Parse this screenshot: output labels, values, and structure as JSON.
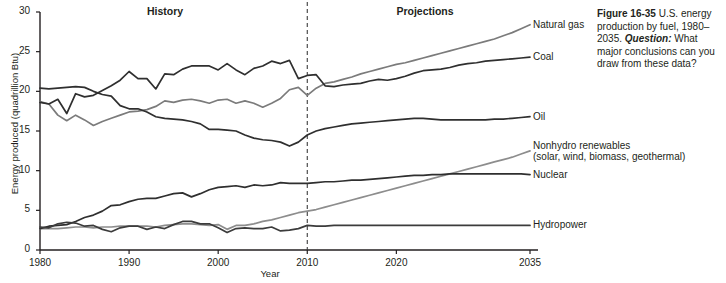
{
  "caption": {
    "figure_number": "Figure 16-35",
    "body_1": " U.S. energy production by fuel, 1980–2035. ",
    "question_label": "Question:",
    "body_2": " What major conclusions can you draw from these data?"
  },
  "chart_data": {
    "type": "line",
    "title": "",
    "xlabel": "Year",
    "ylabel": "Energy produced (quadrillion Btu)",
    "xlim": [
      1980,
      2035
    ],
    "ylim": [
      0,
      30
    ],
    "xticks": [
      1980,
      1990,
      2000,
      2010,
      2020,
      2035
    ],
    "yticks": [
      0,
      5,
      10,
      15,
      20,
      25,
      30
    ],
    "grid": false,
    "legend_position": "right-inline",
    "annotations": [
      {
        "text": "History",
        "x": 1992,
        "y": 31.0,
        "bold": true
      },
      {
        "text": "Projections",
        "x": 2022,
        "y": 31.0,
        "bold": true
      }
    ],
    "divider": {
      "x": 2010,
      "style": "dashed",
      "label": "history/projection boundary"
    },
    "series": [
      {
        "name": "Natural gas",
        "color": "#7b7b7b",
        "label_lines": [
          "Natural gas"
        ],
        "x": [
          1980,
          1981,
          1982,
          1983,
          1984,
          1985,
          1986,
          1987,
          1988,
          1989,
          1990,
          1991,
          1992,
          1993,
          1994,
          1995,
          1996,
          1997,
          1998,
          1999,
          2000,
          2001,
          2002,
          2003,
          2004,
          2005,
          2006,
          2007,
          2008,
          2009,
          2010,
          2011,
          2012,
          2013,
          2014,
          2015,
          2016,
          2017,
          2018,
          2019,
          2020,
          2021,
          2022,
          2023,
          2024,
          2025,
          2026,
          2027,
          2028,
          2029,
          2030,
          2031,
          2032,
          2033,
          2034,
          2035
        ],
        "y": [
          18.7,
          18.4,
          17.0,
          16.3,
          17.0,
          16.4,
          15.7,
          16.2,
          16.6,
          17.0,
          17.4,
          17.5,
          17.7,
          18.1,
          18.8,
          18.6,
          18.9,
          19.0,
          18.8,
          18.5,
          18.9,
          19.0,
          18.5,
          18.8,
          18.5,
          18.0,
          18.5,
          19.1,
          20.2,
          20.5,
          19.5,
          20.4,
          21.0,
          21.2,
          21.5,
          21.8,
          22.2,
          22.5,
          22.8,
          23.1,
          23.4,
          23.6,
          23.9,
          24.2,
          24.5,
          24.8,
          25.1,
          25.4,
          25.7,
          26.0,
          26.3,
          26.6,
          27.0,
          27.4,
          27.9,
          28.4
        ]
      },
      {
        "name": "Coal",
        "color": "#2f2f2f",
        "label_lines": [
          "Coal"
        ],
        "x": [
          1980,
          1981,
          1982,
          1983,
          1984,
          1985,
          1986,
          1987,
          1988,
          1989,
          1990,
          1991,
          1992,
          1993,
          1994,
          1995,
          1996,
          1997,
          1998,
          1999,
          2000,
          2001,
          2002,
          2003,
          2004,
          2005,
          2006,
          2007,
          2008,
          2009,
          2010,
          2011,
          2012,
          2013,
          2014,
          2015,
          2016,
          2017,
          2018,
          2019,
          2020,
          2021,
          2022,
          2023,
          2024,
          2025,
          2026,
          2027,
          2028,
          2029,
          2030,
          2031,
          2032,
          2033,
          2034,
          2035
        ],
        "y": [
          18.6,
          18.4,
          19.0,
          17.2,
          19.7,
          19.3,
          19.5,
          20.1,
          20.7,
          21.4,
          22.5,
          21.6,
          21.6,
          20.3,
          22.2,
          22.1,
          22.8,
          23.2,
          23.2,
          23.2,
          22.7,
          23.5,
          22.7,
          22.1,
          22.9,
          23.2,
          23.8,
          23.5,
          23.9,
          21.6,
          22.0,
          22.1,
          20.7,
          20.6,
          20.8,
          20.9,
          21.0,
          21.3,
          21.5,
          21.4,
          21.6,
          21.9,
          22.3,
          22.6,
          22.7,
          22.8,
          23.0,
          23.3,
          23.5,
          23.6,
          23.8,
          23.9,
          24.0,
          24.1,
          24.2,
          24.3
        ]
      },
      {
        "name": "Oil",
        "color": "#2f2f2f",
        "label_lines": [
          "Oil"
        ],
        "x": [
          1980,
          1981,
          1982,
          1983,
          1984,
          1985,
          1986,
          1987,
          1988,
          1989,
          1990,
          1991,
          1992,
          1993,
          1994,
          1995,
          1996,
          1997,
          1998,
          1999,
          2000,
          2001,
          2002,
          2003,
          2004,
          2005,
          2006,
          2007,
          2008,
          2009,
          2010,
          2011,
          2012,
          2013,
          2014,
          2015,
          2016,
          2017,
          2018,
          2019,
          2020,
          2021,
          2022,
          2023,
          2024,
          2025,
          2026,
          2027,
          2028,
          2029,
          2030,
          2031,
          2032,
          2033,
          2034,
          2035
        ],
        "y": [
          20.4,
          20.3,
          20.4,
          20.5,
          20.6,
          20.5,
          20.0,
          19.6,
          19.4,
          18.2,
          17.8,
          17.8,
          17.4,
          16.8,
          16.6,
          16.5,
          16.4,
          16.2,
          15.9,
          15.2,
          15.2,
          15.1,
          15.0,
          14.5,
          14.1,
          13.9,
          13.8,
          13.6,
          13.1,
          13.6,
          14.5,
          15.0,
          15.3,
          15.5,
          15.7,
          15.9,
          16.0,
          16.1,
          16.2,
          16.3,
          16.4,
          16.5,
          16.6,
          16.6,
          16.5,
          16.4,
          16.4,
          16.4,
          16.4,
          16.4,
          16.4,
          16.5,
          16.5,
          16.6,
          16.7,
          16.8
        ]
      },
      {
        "name": "Nonhydro renewables",
        "color": "#8d8d8d",
        "label_lines": [
          "Nonhydro renewables",
          "(solar, wind, biomass, geothermal)"
        ],
        "x": [
          1980,
          1981,
          1982,
          1983,
          1984,
          1985,
          1986,
          1987,
          1988,
          1989,
          1990,
          1991,
          1992,
          1993,
          1994,
          1995,
          1996,
          1997,
          1998,
          1999,
          2000,
          2001,
          2002,
          2003,
          2004,
          2005,
          2006,
          2007,
          2008,
          2009,
          2010,
          2011,
          2012,
          2013,
          2014,
          2015,
          2016,
          2017,
          2018,
          2019,
          2020,
          2021,
          2022,
          2023,
          2024,
          2025,
          2026,
          2027,
          2028,
          2029,
          2030,
          2031,
          2032,
          2033,
          2034,
          2035
        ],
        "y": [
          2.7,
          2.7,
          2.7,
          2.8,
          2.9,
          2.9,
          2.8,
          2.9,
          2.9,
          3.0,
          3.0,
          3.0,
          3.0,
          2.9,
          3.1,
          3.2,
          3.3,
          3.3,
          3.2,
          3.1,
          3.2,
          2.6,
          3.1,
          3.1,
          3.3,
          3.6,
          3.8,
          4.1,
          4.4,
          4.7,
          4.9,
          5.1,
          5.4,
          5.7,
          6.0,
          6.3,
          6.6,
          6.9,
          7.2,
          7.5,
          7.8,
          8.1,
          8.4,
          8.7,
          9.0,
          9.3,
          9.6,
          9.9,
          10.2,
          10.5,
          10.8,
          11.1,
          11.4,
          11.7,
          12.1,
          12.5
        ]
      },
      {
        "name": "Nuclear",
        "color": "#2f2f2f",
        "label_lines": [
          "Nuclear"
        ],
        "x": [
          1980,
          1981,
          1982,
          1983,
          1984,
          1985,
          1986,
          1987,
          1988,
          1989,
          1990,
          1991,
          1992,
          1993,
          1994,
          1995,
          1996,
          1997,
          1998,
          1999,
          2000,
          2001,
          2002,
          2003,
          2004,
          2005,
          2006,
          2007,
          2008,
          2009,
          2010,
          2011,
          2012,
          2013,
          2014,
          2015,
          2016,
          2017,
          2018,
          2019,
          2020,
          2021,
          2022,
          2023,
          2024,
          2025,
          2026,
          2027,
          2028,
          2029,
          2030,
          2031,
          2032,
          2033,
          2034,
          2035
        ],
        "y": [
          2.7,
          3.0,
          3.1,
          3.2,
          3.6,
          4.1,
          4.4,
          4.9,
          5.6,
          5.7,
          6.1,
          6.4,
          6.5,
          6.5,
          6.8,
          7.1,
          7.2,
          6.7,
          7.1,
          7.6,
          7.9,
          8.0,
          8.1,
          7.9,
          8.2,
          8.1,
          8.2,
          8.5,
          8.4,
          8.4,
          8.4,
          8.5,
          8.6,
          8.6,
          8.7,
          8.8,
          8.8,
          8.9,
          9.0,
          9.1,
          9.2,
          9.3,
          9.4,
          9.4,
          9.5,
          9.5,
          9.6,
          9.6,
          9.6,
          9.6,
          9.6,
          9.6,
          9.6,
          9.6,
          9.6,
          9.5
        ]
      },
      {
        "name": "Hydropower",
        "color": "#3c3c3c",
        "label_lines": [
          "Hydropower"
        ],
        "x": [
          1980,
          1981,
          1982,
          1983,
          1984,
          1985,
          1986,
          1987,
          1988,
          1989,
          1990,
          1991,
          1992,
          1993,
          1994,
          1995,
          1996,
          1997,
          1998,
          1999,
          2000,
          2001,
          2002,
          2003,
          2004,
          2005,
          2006,
          2007,
          2008,
          2009,
          2010,
          2011,
          2012,
          2013,
          2014,
          2015,
          2016,
          2017,
          2018,
          2019,
          2020,
          2021,
          2022,
          2023,
          2024,
          2025,
          2026,
          2027,
          2028,
          2029,
          2030,
          2031,
          2032,
          2033,
          2034,
          2035
        ],
        "y": [
          2.9,
          2.8,
          3.3,
          3.5,
          3.4,
          3.0,
          3.1,
          2.6,
          2.3,
          2.8,
          3.0,
          3.0,
          2.6,
          2.9,
          2.7,
          3.2,
          3.6,
          3.6,
          3.3,
          3.3,
          2.8,
          2.2,
          2.7,
          2.8,
          2.7,
          2.7,
          2.9,
          2.4,
          2.5,
          2.7,
          3.1,
          3.0,
          3.0,
          3.1,
          3.1,
          3.1,
          3.1,
          3.1,
          3.1,
          3.1,
          3.1,
          3.1,
          3.1,
          3.1,
          3.1,
          3.1,
          3.1,
          3.1,
          3.1,
          3.1,
          3.1,
          3.1,
          3.1,
          3.1,
          3.1,
          3.1
        ]
      }
    ]
  }
}
